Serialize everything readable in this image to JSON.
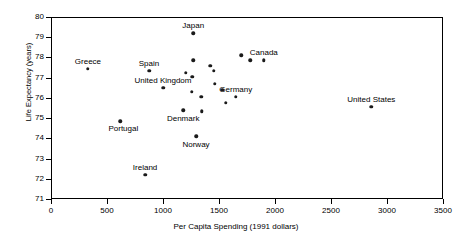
{
  "chart_data": {
    "type": "scatter",
    "title": "",
    "xlabel": "Per Capita Spending (1991 dollars)",
    "ylabel": "Life Expectancy (years)",
    "xlim": [
      0,
      3500
    ],
    "ylim": [
      71,
      80
    ],
    "xticks": [
      0,
      500,
      1000,
      1500,
      2000,
      2500,
      3000,
      3500
    ],
    "xtick_labels": [
      "0",
      "500",
      "1000",
      "1500",
      "2000",
      "2500",
      "3000",
      "3500"
    ],
    "yticks": [
      71,
      72,
      73,
      74,
      75,
      76,
      77,
      78,
      79,
      80
    ],
    "ytick_labels": [
      "71",
      "72",
      "73",
      "74",
      "75",
      "76",
      "77",
      "78",
      "79",
      "80"
    ],
    "grid": false,
    "legend": null,
    "marker": "filled-circle",
    "marker_color": "#1a1a1a",
    "points": [
      {
        "name": "Greece",
        "x": 330,
        "y": 77.45,
        "labeled": true,
        "label_dx": 0,
        "label_dy": -11
      },
      {
        "name": "Spain",
        "x": 875,
        "y": 77.35,
        "labeled": true,
        "label_dx": 0,
        "label_dy": -11
      },
      {
        "name": "United Kingdom",
        "x": 1000,
        "y": 76.5,
        "labeled": true,
        "label_dx": 0,
        "label_dy": -11
      },
      {
        "name": "Portugal",
        "x": 620,
        "y": 74.85,
        "labeled": true,
        "label_dx": 6,
        "label_dy": 4
      },
      {
        "name": "Ireland",
        "x": 840,
        "y": 72.2,
        "labeled": true,
        "label_dx": 0,
        "label_dy": -11
      },
      {
        "name": "Denmark",
        "x": 1180,
        "y": 75.4,
        "labeled": true,
        "label_dx": 0,
        "label_dy": 5
      },
      {
        "name": "Japan",
        "x": 1270,
        "y": 79.2,
        "labeled": true,
        "label_dx": 0,
        "label_dy": -11
      },
      {
        "name": "Norway",
        "x": 1295,
        "y": 74.1,
        "labeled": true,
        "label_dx": 0,
        "label_dy": 5
      },
      {
        "name": "Germany",
        "x": 1650,
        "y": 76.05,
        "labeled": true,
        "label_dx": 0,
        "label_dy": -11
      },
      {
        "name": "Canada",
        "x": 1900,
        "y": 77.85,
        "labeled": true,
        "label_dx": 0,
        "label_dy": -11
      },
      {
        "name": "United States",
        "x": 2860,
        "y": 75.55,
        "labeled": true,
        "label_dx": 0,
        "label_dy": -11
      },
      {
        "name": "",
        "x": 1270,
        "y": 77.85,
        "labeled": false,
        "label_dx": 0,
        "label_dy": 0
      },
      {
        "name": "",
        "x": 1205,
        "y": 77.25,
        "labeled": false,
        "label_dx": 0,
        "label_dy": 0
      },
      {
        "name": "",
        "x": 1260,
        "y": 77.05,
        "labeled": false,
        "label_dx": 0,
        "label_dy": 0
      },
      {
        "name": "",
        "x": 1255,
        "y": 76.3,
        "labeled": false,
        "label_dx": 0,
        "label_dy": 0
      },
      {
        "name": "",
        "x": 1340,
        "y": 76.05,
        "labeled": false,
        "label_dx": 0,
        "label_dy": 0
      },
      {
        "name": "",
        "x": 1345,
        "y": 75.35,
        "labeled": false,
        "label_dx": 0,
        "label_dy": 0
      },
      {
        "name": "",
        "x": 1420,
        "y": 77.6,
        "labeled": false,
        "label_dx": 0,
        "label_dy": 0
      },
      {
        "name": "",
        "x": 1455,
        "y": 77.35,
        "labeled": false,
        "label_dx": 0,
        "label_dy": 0
      },
      {
        "name": "",
        "x": 1460,
        "y": 76.7,
        "labeled": false,
        "label_dx": 0,
        "label_dy": 0
      },
      {
        "name": "",
        "x": 1530,
        "y": 76.4,
        "labeled": false,
        "label_dx": 0,
        "label_dy": 0
      },
      {
        "name": "",
        "x": 1560,
        "y": 75.75,
        "labeled": false,
        "label_dx": 0,
        "label_dy": 0
      },
      {
        "name": "",
        "x": 1700,
        "y": 78.1,
        "labeled": false,
        "label_dx": 0,
        "label_dy": 0
      },
      {
        "name": "",
        "x": 1780,
        "y": 77.85,
        "labeled": false,
        "label_dx": 0,
        "label_dy": 0
      }
    ]
  }
}
